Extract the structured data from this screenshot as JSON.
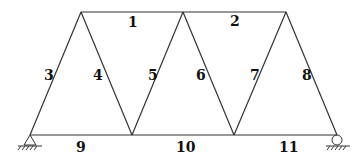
{
  "diagram": {
    "type": "truss",
    "nodes": {
      "A": {
        "x": 30,
        "y": 135
      },
      "B": {
        "x": 132,
        "y": 135
      },
      "C": {
        "x": 234,
        "y": 135
      },
      "D": {
        "x": 337,
        "y": 135
      },
      "E": {
        "x": 81,
        "y": 12
      },
      "F": {
        "x": 183,
        "y": 12
      },
      "G": {
        "x": 286,
        "y": 12
      }
    },
    "members": [
      {
        "id": "1",
        "label": "1",
        "from": "E",
        "to": "F"
      },
      {
        "id": "2",
        "label": "2",
        "from": "F",
        "to": "G"
      },
      {
        "id": "3",
        "label": "3",
        "from": "A",
        "to": "E"
      },
      {
        "id": "4",
        "label": "4",
        "from": "E",
        "to": "B"
      },
      {
        "id": "5",
        "label": "5",
        "from": "B",
        "to": "F"
      },
      {
        "id": "6",
        "label": "6",
        "from": "F",
        "to": "C"
      },
      {
        "id": "7",
        "label": "7",
        "from": "C",
        "to": "G"
      },
      {
        "id": "8",
        "label": "8",
        "from": "G",
        "to": "D"
      },
      {
        "id": "9",
        "label": "9",
        "from": "A",
        "to": "B"
      },
      {
        "id": "10",
        "label": "10",
        "from": "B",
        "to": "C"
      },
      {
        "id": "11",
        "label": "11",
        "from": "C",
        "to": "D"
      }
    ],
    "supports": [
      {
        "node": "A",
        "type": "pin"
      },
      {
        "node": "D",
        "type": "roller"
      }
    ]
  }
}
